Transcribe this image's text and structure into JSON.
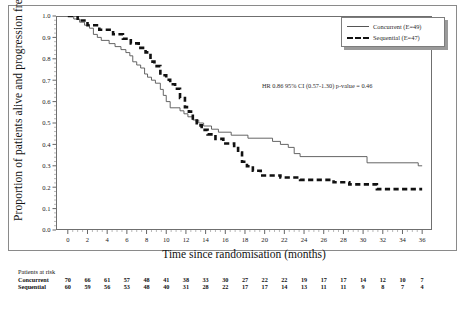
{
  "chart_data": {
    "type": "line",
    "title": "",
    "xlabel": "Time since randomisation (months)",
    "ylabel": "Proportion of patients alive and progression free",
    "xlim": [
      -1.2,
      37
    ],
    "ylim": [
      0.0,
      1.0
    ],
    "xticks": [
      0,
      2,
      4,
      6,
      8,
      10,
      12,
      14,
      16,
      18,
      20,
      22,
      24,
      26,
      28,
      30,
      32,
      34,
      36
    ],
    "xticklabels": [
      "0",
      "2",
      "4",
      "6",
      "8",
      "10",
      "12",
      "14",
      "16",
      "18",
      "20",
      "22",
      "24",
      "26",
      "28",
      "30",
      "32",
      "34",
      "36"
    ],
    "yticks": [
      0.0,
      0.1,
      0.2,
      0.3,
      0.4,
      0.5,
      0.6,
      0.7,
      0.8,
      0.9,
      1.0
    ],
    "yticklabels": [
      "0.0",
      "0.1",
      "0.2",
      "0.3",
      "0.4",
      "0.5",
      "0.6",
      "0.7",
      "0.8",
      "0.9",
      "1.0"
    ],
    "grid": false,
    "legend_position": "top-right",
    "annotation": "HR 0.86 95% CI (0.57-1.30) p-value = 0.46",
    "series": [
      {
        "name": "Concurrent (E=49)",
        "style": "solid",
        "color": "#555555",
        "points": [
          [
            0.0,
            1.0
          ],
          [
            0.6,
            1.0
          ],
          [
            0.6,
            0.986
          ],
          [
            1.2,
            0.986
          ],
          [
            1.2,
            0.971
          ],
          [
            1.7,
            0.971
          ],
          [
            1.7,
            0.957
          ],
          [
            2.2,
            0.957
          ],
          [
            2.2,
            0.943
          ],
          [
            2.6,
            0.943
          ],
          [
            2.6,
            0.914
          ],
          [
            3.0,
            0.914
          ],
          [
            3.0,
            0.9
          ],
          [
            3.4,
            0.9
          ],
          [
            3.4,
            0.886
          ],
          [
            4.2,
            0.886
          ],
          [
            4.2,
            0.871
          ],
          [
            4.8,
            0.871
          ],
          [
            4.8,
            0.857
          ],
          [
            5.4,
            0.857
          ],
          [
            5.4,
            0.843
          ],
          [
            5.9,
            0.843
          ],
          [
            5.9,
            0.829
          ],
          [
            6.3,
            0.829
          ],
          [
            6.3,
            0.814
          ],
          [
            6.6,
            0.814
          ],
          [
            6.6,
            0.786
          ],
          [
            7.0,
            0.786
          ],
          [
            7.0,
            0.771
          ],
          [
            7.4,
            0.771
          ],
          [
            7.4,
            0.757
          ],
          [
            7.8,
            0.757
          ],
          [
            7.8,
            0.729
          ],
          [
            8.1,
            0.729
          ],
          [
            8.1,
            0.714
          ],
          [
            8.5,
            0.714
          ],
          [
            8.5,
            0.7
          ],
          [
            8.9,
            0.7
          ],
          [
            8.9,
            0.686
          ],
          [
            9.4,
            0.686
          ],
          [
            9.4,
            0.657
          ],
          [
            9.7,
            0.657
          ],
          [
            9.7,
            0.629
          ],
          [
            10.0,
            0.629
          ],
          [
            10.0,
            0.6
          ],
          [
            10.4,
            0.6
          ],
          [
            10.4,
            0.571
          ],
          [
            11.4,
            0.571
          ],
          [
            11.4,
            0.557
          ],
          [
            11.8,
            0.557
          ],
          [
            11.8,
            0.543
          ],
          [
            12.2,
            0.543
          ],
          [
            12.2,
            0.529
          ],
          [
            12.7,
            0.529
          ],
          [
            12.7,
            0.514
          ],
          [
            13.3,
            0.514
          ],
          [
            13.3,
            0.5
          ],
          [
            13.8,
            0.5
          ],
          [
            13.8,
            0.486
          ],
          [
            14.6,
            0.486
          ],
          [
            14.6,
            0.471
          ],
          [
            15.3,
            0.471
          ],
          [
            15.3,
            0.457
          ],
          [
            16.6,
            0.457
          ],
          [
            16.6,
            0.443
          ],
          [
            18.3,
            0.443
          ],
          [
            18.3,
            0.429
          ],
          [
            20.8,
            0.429
          ],
          [
            20.8,
            0.414
          ],
          [
            21.6,
            0.414
          ],
          [
            21.6,
            0.4
          ],
          [
            22.4,
            0.4
          ],
          [
            22.4,
            0.386
          ],
          [
            23.0,
            0.386
          ],
          [
            23.0,
            0.357
          ],
          [
            23.6,
            0.357
          ],
          [
            23.6,
            0.343
          ],
          [
            30.4,
            0.343
          ],
          [
            30.4,
            0.314
          ],
          [
            35.6,
            0.314
          ],
          [
            35.6,
            0.3
          ],
          [
            36.0,
            0.3
          ]
        ]
      },
      {
        "name": "Sequential (E=47)",
        "style": "dashed",
        "color": "#111111",
        "points": [
          [
            0.0,
            1.0
          ],
          [
            1.0,
            1.0
          ],
          [
            1.0,
            0.979
          ],
          [
            2.0,
            0.979
          ],
          [
            2.0,
            0.957
          ],
          [
            3.2,
            0.957
          ],
          [
            3.2,
            0.936
          ],
          [
            4.6,
            0.936
          ],
          [
            4.6,
            0.915
          ],
          [
            5.6,
            0.915
          ],
          [
            5.6,
            0.894
          ],
          [
            6.4,
            0.894
          ],
          [
            6.4,
            0.872
          ],
          [
            7.2,
            0.872
          ],
          [
            7.2,
            0.851
          ],
          [
            7.9,
            0.851
          ],
          [
            7.9,
            0.83
          ],
          [
            8.4,
            0.83
          ],
          [
            8.4,
            0.787
          ],
          [
            8.8,
            0.787
          ],
          [
            8.8,
            0.766
          ],
          [
            9.4,
            0.766
          ],
          [
            9.4,
            0.723
          ],
          [
            10.0,
            0.723
          ],
          [
            10.0,
            0.702
          ],
          [
            10.4,
            0.702
          ],
          [
            10.4,
            0.681
          ],
          [
            10.9,
            0.681
          ],
          [
            10.9,
            0.66
          ],
          [
            11.4,
            0.66
          ],
          [
            11.4,
            0.617
          ],
          [
            11.9,
            0.617
          ],
          [
            11.9,
            0.574
          ],
          [
            12.3,
            0.574
          ],
          [
            12.3,
            0.553
          ],
          [
            12.7,
            0.553
          ],
          [
            12.7,
            0.511
          ],
          [
            13.1,
            0.511
          ],
          [
            13.1,
            0.489
          ],
          [
            13.6,
            0.489
          ],
          [
            13.6,
            0.468
          ],
          [
            14.2,
            0.468
          ],
          [
            14.2,
            0.447
          ],
          [
            15.0,
            0.447
          ],
          [
            15.0,
            0.426
          ],
          [
            15.8,
            0.426
          ],
          [
            15.8,
            0.404
          ],
          [
            16.9,
            0.404
          ],
          [
            16.9,
            0.383
          ],
          [
            17.3,
            0.383
          ],
          [
            17.3,
            0.362
          ],
          [
            17.7,
            0.362
          ],
          [
            17.7,
            0.319
          ],
          [
            18.2,
            0.319
          ],
          [
            18.2,
            0.298
          ],
          [
            18.8,
            0.298
          ],
          [
            18.8,
            0.277
          ],
          [
            19.6,
            0.277
          ],
          [
            19.6,
            0.255
          ],
          [
            21.6,
            0.255
          ],
          [
            21.6,
            0.245
          ],
          [
            23.6,
            0.245
          ],
          [
            23.6,
            0.234
          ],
          [
            27.0,
            0.234
          ],
          [
            27.0,
            0.223
          ],
          [
            28.6,
            0.223
          ],
          [
            28.6,
            0.213
          ],
          [
            31.4,
            0.213
          ],
          [
            31.4,
            0.191
          ],
          [
            36.0,
            0.191
          ]
        ]
      }
    ]
  },
  "legend": {
    "items": [
      {
        "label": "Concurrent (E=49)",
        "style": "solid"
      },
      {
        "label": "Sequential (E=47)",
        "style": "dashed"
      }
    ]
  },
  "annotation": {
    "hr_text": "HR 0.86 95% CI (0.57-1.30) p-value = 0.46"
  },
  "axes": {
    "x_title": "Time since randomisation (months)",
    "y_title": "Proportion of patients alive and progression free"
  },
  "risk_table": {
    "title": "Patients at risk",
    "times": [
      0,
      2,
      4,
      6,
      8,
      10,
      12,
      14,
      16,
      18,
      20,
      22,
      24,
      26,
      28,
      30,
      32,
      34,
      36
    ],
    "rows": [
      {
        "name": "Concurrent",
        "values": [
          "70",
          "66",
          "61",
          "57",
          "48",
          "41",
          "38",
          "33",
          "30",
          "27",
          "22",
          "22",
          "19",
          "17",
          "17",
          "14",
          "12",
          "10",
          "7"
        ]
      },
      {
        "name": "Sequential",
        "values": [
          "60",
          "59",
          "56",
          "53",
          "48",
          "40",
          "31",
          "28",
          "22",
          "17",
          "17",
          "14",
          "13",
          "11",
          "11",
          "9",
          "8",
          "7",
          "4"
        ]
      }
    ]
  }
}
